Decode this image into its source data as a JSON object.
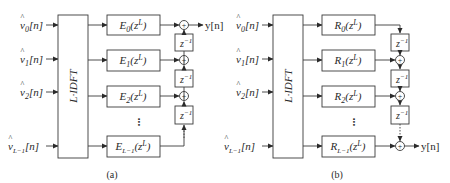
{
  "panels": [
    {
      "id": "a",
      "caption": "(a)",
      "inputs": [
        {
          "base": "v",
          "sub": "0",
          "arg": "[n]"
        },
        {
          "base": "v",
          "sub": "1",
          "arg": "[n]"
        },
        {
          "base": "v",
          "sub": "2",
          "arg": "[n]"
        },
        {
          "base": "v",
          "sub": "L−1",
          "arg": "[n]"
        }
      ],
      "transform_label": "L·IDFT",
      "filters": [
        {
          "name": "E",
          "sub": "0",
          "arg": "(z",
          "sup": "L",
          "close": ")"
        },
        {
          "name": "E",
          "sub": "1",
          "arg": "(z",
          "sup": "L",
          "close": ")"
        },
        {
          "name": "E",
          "sub": "2",
          "arg": "(z",
          "sup": "L",
          "close": ")"
        },
        {
          "name": "E",
          "sub": "L−1",
          "arg": "(z",
          "sup": "L",
          "close": ")"
        }
      ],
      "delays": [
        {
          "base": "z",
          "sup": "−1"
        },
        {
          "base": "z",
          "sup": "−1"
        },
        {
          "base": "z",
          "sup": "−1"
        }
      ],
      "sum_symbol": "+",
      "output": "y[n]",
      "ellipsis": "•••"
    },
    {
      "id": "b",
      "caption": "(b)",
      "inputs": [
        {
          "base": "v",
          "sub": "0",
          "arg": "[n]"
        },
        {
          "base": "v",
          "sub": "1",
          "arg": "[n]"
        },
        {
          "base": "v",
          "sub": "2",
          "arg": "[n]"
        },
        {
          "base": "v",
          "sub": "L−1",
          "arg": "[n]"
        }
      ],
      "transform_label": "L·IDFT",
      "filters": [
        {
          "name": "R",
          "sub": "0",
          "arg": "(z",
          "sup": "L",
          "close": ")"
        },
        {
          "name": "R",
          "sub": "1",
          "arg": "(z",
          "sup": "L",
          "close": ")"
        },
        {
          "name": "R",
          "sub": "2",
          "arg": "(z",
          "sup": "L",
          "close": ")"
        },
        {
          "name": "R",
          "sub": "L−1",
          "arg": "(z",
          "sup": "L",
          "close": ")"
        }
      ],
      "delays": [
        {
          "base": "z",
          "sup": "−1"
        },
        {
          "base": "z",
          "sup": "−1"
        },
        {
          "base": "z",
          "sup": "−1"
        }
      ],
      "sum_symbol": "+",
      "output": "y[n]",
      "ellipsis": "•••"
    }
  ],
  "colors": {
    "stroke": "#3a3a3a",
    "text": "#2a2a2a",
    "box_fill": "#ffffff"
  }
}
